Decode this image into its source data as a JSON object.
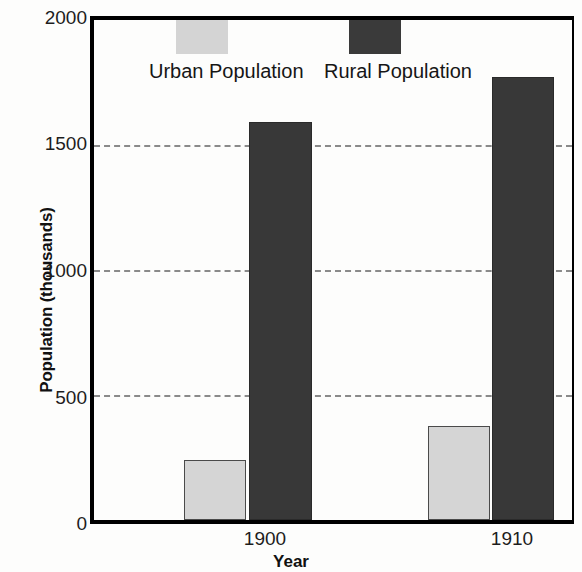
{
  "chart_data": {
    "type": "bar",
    "title": "",
    "xlabel": "Year",
    "ylabel": "Population (thousands)",
    "categories": [
      "1900",
      "1910"
    ],
    "series": [
      {
        "name": "Urban Population",
        "values": [
          240,
          375
        ],
        "color": "#d5d5d5"
      },
      {
        "name": "Rural Population",
        "values": [
          1590,
          1770
        ],
        "color": "#383838"
      }
    ],
    "ylim": [
      0,
      2000
    ],
    "yticks": [
      0,
      500,
      1000,
      1500,
      2000
    ],
    "ytick_labels": [
      "0",
      "500",
      "1000",
      "1500",
      "2000"
    ],
    "grid": "horizontal-dashed",
    "legend_position": "top-inside"
  },
  "axes": {
    "y_title": "Population (thousands)",
    "x_title": "Year",
    "y_ticks": [
      {
        "label": "2000",
        "value": 2000
      },
      {
        "label": "1500",
        "value": 1500
      },
      {
        "label": "1000",
        "value": 1000
      },
      {
        "label": "500",
        "value": 500
      },
      {
        "label": "0",
        "value": 0
      }
    ],
    "x_ticks": [
      {
        "label": "1900"
      },
      {
        "label": "1910"
      }
    ]
  },
  "legend": {
    "entries": [
      {
        "label": "Urban Population",
        "color": "#d4d4d4"
      },
      {
        "label": "Rural Population",
        "color": "#3a3a3a"
      }
    ]
  }
}
